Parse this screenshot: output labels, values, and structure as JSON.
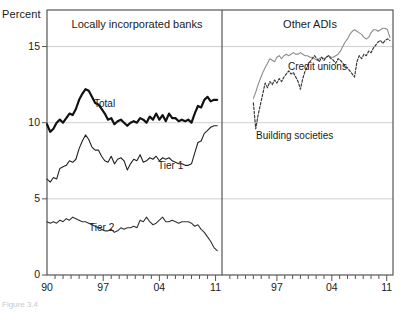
{
  "figure": {
    "caption_fragment": "Figure 3.4",
    "axis_unit_label": "Percent"
  },
  "panels": [
    {
      "id": "left",
      "title": "Locally incorporated banks"
    },
    {
      "id": "right",
      "title": "Other ADIs"
    }
  ],
  "series_labels": {
    "total": "Total",
    "tier1": "Tier 1",
    "tier2": "Tier 2",
    "credit_unions": "Credit unions",
    "building_societies": "Building societies"
  },
  "colors": {
    "total": "#111111",
    "tier1": "#222222",
    "tier2": "#333333",
    "credit_unions": "#8d8d8d",
    "building_societies": "#3a3a3a",
    "frame": "#555555",
    "gridline": "#cfcfcf",
    "text": "#1a1a1a"
  },
  "chart_data": {
    "type": "line",
    "title": "",
    "xlabel": "",
    "ylabel": "Percent",
    "ylim": [
      0,
      17.4
    ],
    "yticks": [
      0,
      5,
      10,
      15
    ],
    "ytick_labels": [
      "0",
      "5",
      "10",
      "15"
    ],
    "grid": "horizontal",
    "legend": "inline-annotations",
    "panels": [
      {
        "name": "Locally incorporated banks",
        "xlim": [
          1990,
          2011.8
        ],
        "xticks": [
          1990,
          1997,
          2004,
          2011
        ],
        "xtick_labels": [
          "90",
          "97",
          "04",
          "11"
        ],
        "minor_tick_interval": 1,
        "series": [
          {
            "name": "Total",
            "style": "solid-thick",
            "color": "#111111",
            "x": [
              1990.0,
              1990.4,
              1990.8,
              1991.2,
              1991.6,
              1992.0,
              1992.4,
              1992.8,
              1993.2,
              1993.6,
              1994.0,
              1994.4,
              1994.8,
              1995.2,
              1995.6,
              1996.0,
              1996.4,
              1996.8,
              1997.2,
              1997.6,
              1998.0,
              1998.4,
              1998.8,
              1999.2,
              1999.6,
              2000.0,
              2000.4,
              2000.8,
              2001.2,
              2001.6,
              2002.0,
              2002.4,
              2002.8,
              2003.2,
              2003.6,
              2004.0,
              2004.4,
              2004.8,
              2005.2,
              2005.6,
              2006.0,
              2006.4,
              2006.8,
              2007.2,
              2007.6,
              2008.0,
              2008.4,
              2008.8,
              2009.2,
              2009.6,
              2010.0,
              2010.4,
              2010.8,
              2011.2
            ],
            "y": [
              9.9,
              9.4,
              9.6,
              10.0,
              10.2,
              10.0,
              10.3,
              10.6,
              10.5,
              10.9,
              11.5,
              11.9,
              12.2,
              12.1,
              11.7,
              11.3,
              11.2,
              10.9,
              10.6,
              10.2,
              10.3,
              9.9,
              10.1,
              10.2,
              10.0,
              9.8,
              10.0,
              10.1,
              10.0,
              10.3,
              10.2,
              10.0,
              10.4,
              10.2,
              10.6,
              10.2,
              10.5,
              10.1,
              10.6,
              10.3,
              10.3,
              10.1,
              10.2,
              10.1,
              10.2,
              10.0,
              10.6,
              11.1,
              11.0,
              11.5,
              11.7,
              11.4,
              11.5,
              11.5
            ]
          },
          {
            "name": "Tier 1",
            "style": "solid-thin",
            "color": "#222222",
            "x": [
              1990.0,
              1990.4,
              1990.8,
              1991.2,
              1991.6,
              1992.0,
              1992.4,
              1992.8,
              1993.2,
              1993.6,
              1994.0,
              1994.4,
              1994.8,
              1995.2,
              1995.6,
              1996.0,
              1996.4,
              1996.8,
              1997.2,
              1997.6,
              1998.0,
              1998.4,
              1998.8,
              1999.2,
              1999.6,
              2000.0,
              2000.4,
              2000.8,
              2001.2,
              2001.6,
              2002.0,
              2002.4,
              2002.8,
              2003.2,
              2003.6,
              2004.0,
              2004.4,
              2004.8,
              2005.2,
              2005.6,
              2006.0,
              2006.4,
              2006.8,
              2007.2,
              2007.6,
              2008.0,
              2008.4,
              2008.8,
              2009.2,
              2009.6,
              2010.0,
              2010.4,
              2010.8,
              2011.2
            ],
            "y": [
              6.3,
              6.1,
              6.4,
              6.3,
              7.0,
              7.1,
              7.2,
              7.5,
              7.4,
              7.6,
              8.3,
              8.8,
              9.2,
              8.9,
              8.4,
              8.2,
              8.2,
              7.8,
              7.5,
              7.4,
              7.8,
              7.3,
              7.6,
              7.7,
              7.5,
              6.9,
              7.3,
              7.6,
              7.5,
              7.9,
              7.4,
              7.5,
              7.7,
              7.6,
              7.8,
              7.5,
              7.7,
              7.6,
              7.7,
              7.5,
              7.4,
              7.3,
              7.3,
              7.2,
              7.2,
              7.3,
              8.0,
              8.7,
              8.8,
              9.3,
              9.5,
              9.7,
              9.8,
              9.8
            ]
          },
          {
            "name": "Tier 2",
            "style": "solid-thin",
            "color": "#333333",
            "x": [
              1990.0,
              1990.4,
              1990.8,
              1991.2,
              1991.6,
              1992.0,
              1992.4,
              1992.8,
              1993.2,
              1993.6,
              1994.0,
              1994.4,
              1994.8,
              1995.2,
              1995.6,
              1996.0,
              1996.4,
              1996.8,
              1997.2,
              1997.6,
              1998.0,
              1998.4,
              1998.8,
              1999.2,
              1999.6,
              2000.0,
              2000.4,
              2000.8,
              2001.2,
              2001.6,
              2002.0,
              2002.4,
              2002.8,
              2003.2,
              2003.6,
              2004.0,
              2004.4,
              2004.8,
              2005.2,
              2005.6,
              2006.0,
              2006.4,
              2006.8,
              2007.2,
              2007.6,
              2008.0,
              2008.4,
              2008.8,
              2009.2,
              2009.6,
              2010.0,
              2010.4,
              2010.8,
              2011.2
            ],
            "y": [
              3.5,
              3.4,
              3.5,
              3.4,
              3.6,
              3.5,
              3.7,
              3.6,
              3.8,
              3.7,
              3.6,
              3.5,
              3.5,
              3.4,
              3.3,
              3.2,
              3.1,
              3.0,
              2.9,
              2.9,
              3.0,
              2.8,
              2.9,
              3.1,
              3.0,
              3.1,
              3.1,
              3.2,
              3.1,
              3.6,
              3.5,
              3.8,
              3.5,
              3.3,
              3.4,
              3.6,
              3.8,
              3.5,
              3.5,
              3.6,
              3.5,
              3.4,
              3.5,
              3.5,
              3.5,
              3.4,
              3.2,
              3.3,
              3.0,
              2.8,
              2.5,
              2.2,
              1.8,
              1.6
            ]
          }
        ]
      },
      {
        "name": "Other ADIs",
        "xlim": [
          1990,
          2011.8
        ],
        "xticks": [
          1997,
          2004,
          2011
        ],
        "xtick_labels": [
          "97",
          "04",
          "11"
        ],
        "minor_tick_interval": 1,
        "series": [
          {
            "name": "Credit unions",
            "style": "solid-thin",
            "color": "#8d8d8d",
            "x": [
              1994.0,
              1994.3,
              1994.6,
              1994.9,
              1995.2,
              1995.5,
              1995.8,
              1996.1,
              1996.4,
              1996.7,
              1997.0,
              1997.3,
              1997.6,
              1997.9,
              1998.2,
              1998.5,
              1998.8,
              1999.1,
              1999.4,
              1999.7,
              2000.0,
              2000.3,
              2000.6,
              2000.9,
              2001.2,
              2001.5,
              2001.8,
              2002.1,
              2002.4,
              2002.7,
              2003.0,
              2003.3,
              2003.6,
              2003.9,
              2004.2,
              2004.5,
              2004.8,
              2005.1,
              2005.4,
              2005.7,
              2006.0,
              2006.3,
              2006.6,
              2006.9,
              2007.2,
              2007.5,
              2007.8,
              2008.1,
              2008.4,
              2008.7,
              2009.0,
              2009.3,
              2009.6,
              2009.9,
              2010.2,
              2010.5,
              2010.8,
              2011.1,
              2011.4
            ],
            "y": [
              11.6,
              12.0,
              12.5,
              12.9,
              13.3,
              13.6,
              13.9,
              14.2,
              14.1,
              14.0,
              14.3,
              14.4,
              14.2,
              14.4,
              14.5,
              14.4,
              14.5,
              14.6,
              14.5,
              14.5,
              14.6,
              14.5,
              14.4,
              14.4,
              14.3,
              14.3,
              14.2,
              14.1,
              14.2,
              14.3,
              14.2,
              14.3,
              14.4,
              14.3,
              14.3,
              14.4,
              14.5,
              14.7,
              15.0,
              15.3,
              15.5,
              15.8,
              16.0,
              16.1,
              16.0,
              15.9,
              15.8,
              15.6,
              15.5,
              15.6,
              15.9,
              16.1,
              16.1,
              16.0,
              16.1,
              16.2,
              16.2,
              16.1,
              15.6
            ]
          },
          {
            "name": "Building societies",
            "style": "dashed",
            "color": "#3a3a3a",
            "x": [
              1994.0,
              1994.3,
              1994.6,
              1994.9,
              1995.2,
              1995.5,
              1995.8,
              1996.1,
              1996.4,
              1996.7,
              1997.0,
              1997.3,
              1997.6,
              1997.9,
              1998.2,
              1998.5,
              1998.8,
              1999.1,
              1999.4,
              1999.7,
              2000.0,
              2000.3,
              2000.6,
              2000.9,
              2001.2,
              2001.5,
              2001.8,
              2002.1,
              2002.4,
              2002.7,
              2003.0,
              2003.3,
              2003.6,
              2003.9,
              2004.2,
              2004.5,
              2004.8,
              2005.1,
              2005.4,
              2005.7,
              2006.0,
              2006.3,
              2006.6,
              2006.9,
              2007.2,
              2007.5,
              2007.8,
              2008.1,
              2008.4,
              2008.7,
              2009.0,
              2009.3,
              2009.6,
              2009.9,
              2010.2,
              2010.5,
              2010.8,
              2011.1,
              2011.4
            ],
            "y": [
              11.3,
              9.6,
              10.5,
              11.2,
              11.9,
              12.6,
              12.3,
              12.7,
              12.5,
              12.8,
              12.6,
              12.9,
              12.7,
              13.0,
              13.2,
              13.4,
              13.2,
              13.3,
              13.0,
              12.7,
              12.2,
              12.9,
              13.4,
              13.7,
              14.0,
              14.2,
              14.4,
              14.2,
              14.0,
              14.3,
              14.1,
              14.3,
              14.4,
              14.2,
              14.1,
              13.9,
              14.2,
              14.1,
              13.9,
              13.7,
              13.6,
              13.4,
              13.2,
              13.0,
              14.0,
              14.4,
              14.2,
              14.5,
              14.4,
              14.7,
              14.6,
              14.9,
              15.1,
              15.3,
              15.4,
              15.2,
              15.4,
              15.5,
              15.4
            ]
          }
        ]
      }
    ]
  }
}
